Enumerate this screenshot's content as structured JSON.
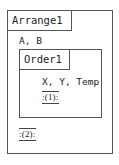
{
  "outer": {
    "title": "Arrange1",
    "params": "A, B",
    "marker": ":(2):"
  },
  "inner": {
    "title": "Order1",
    "params": "X, Y, Temp",
    "marker": ":(1):"
  }
}
